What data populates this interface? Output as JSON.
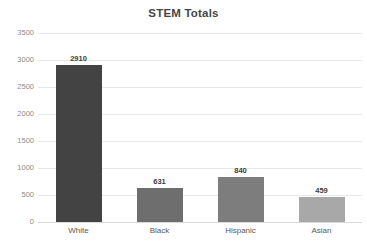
{
  "chart_data": {
    "type": "bar",
    "title": "STEM Totals",
    "xlabel": "",
    "ylabel": "",
    "categories": [
      "White",
      "Black",
      "Hispanic",
      "Asian"
    ],
    "values": [
      2910,
      631,
      840,
      459
    ],
    "value_labels": [
      "2910",
      "631",
      "840",
      "459"
    ],
    "ylim": [
      0,
      3500
    ],
    "y_ticks": [
      0,
      500,
      1000,
      1500,
      2000,
      2500,
      3000,
      3500
    ],
    "y_tick_labels": [
      "0",
      "500",
      "1000",
      "1500",
      "2000",
      "2500",
      "3000",
      "3500"
    ],
    "grid": true,
    "legend": false,
    "legend_position": "none",
    "bar_colors": [
      "#434343",
      "#6e6e6e",
      "#7d7d7d",
      "#a8a8a8"
    ],
    "title_color": "#464646",
    "tick_label_color": "#8c8c8c",
    "category_label_color": "#595959",
    "value_label_color": "#3c3c3c",
    "gridline_color": "#e8e8e8",
    "background_color": "#ffffff"
  }
}
